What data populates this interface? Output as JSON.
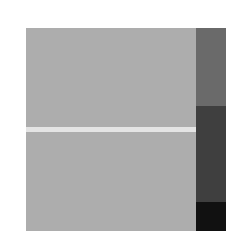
{
  "image": {
    "background": "#ffffff",
    "main_panel": {
      "color": "#adadad"
    },
    "horizontal_stripe": {
      "color": "#e4e4e4"
    },
    "side_bar": {
      "segments": [
        {
          "name": "upper",
          "color": "#6a6a6a"
        },
        {
          "name": "middle",
          "color": "#3f3f3f"
        },
        {
          "name": "lower",
          "color": "#111111"
        }
      ]
    }
  }
}
